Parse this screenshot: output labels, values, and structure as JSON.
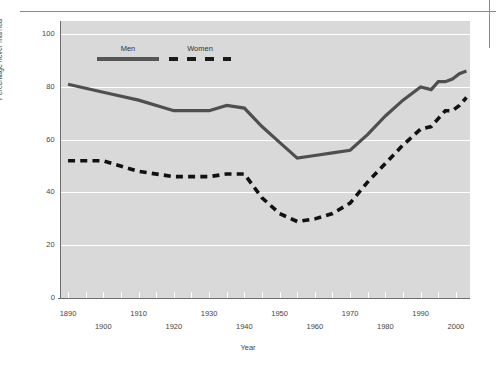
{
  "figure": {
    "background_color": "#ffffff",
    "plot_background_color": "#d9d9d9",
    "rule_color": "#8a8a8a"
  },
  "chart_data": {
    "type": "line",
    "title": "",
    "xlabel": "Year",
    "ylabel": "Percentage never married",
    "xlim": [
      1888,
      2004
    ],
    "ylim": [
      0,
      105
    ],
    "yticks": [
      0,
      20,
      40,
      60,
      80,
      100
    ],
    "ytick_labels": [
      "0",
      "20",
      "40",
      "60",
      "80",
      "100"
    ],
    "xticks": [
      1890,
      1900,
      1910,
      1920,
      1930,
      1940,
      1950,
      1960,
      1970,
      1980,
      1990,
      2000
    ],
    "xtick_labels": [
      "1890",
      "1900",
      "1910",
      "1920",
      "1930",
      "1940",
      "1950",
      "1960",
      "1970",
      "1980",
      "1990",
      "2000"
    ],
    "grid": "horizontal-white",
    "legend_position": "upper-left-inside",
    "colors": {
      "men": "#4f4f4f",
      "women": "#111111"
    },
    "series": [
      {
        "name": "Men",
        "style": "solid",
        "color": "#4f4f4f",
        "x": [
          1890,
          1900,
          1910,
          1920,
          1930,
          1935,
          1940,
          1945,
          1950,
          1955,
          1960,
          1965,
          1970,
          1975,
          1980,
          1985,
          1990,
          1993,
          1995,
          1997,
          1999,
          2001,
          2003
        ],
        "values": [
          81,
          78,
          75,
          71,
          71,
          73,
          72,
          65,
          59,
          53,
          54,
          55,
          56,
          62,
          69,
          75,
          80,
          79,
          82,
          82,
          83,
          85,
          86
        ]
      },
      {
        "name": "Women",
        "style": "dashed",
        "color": "#111111",
        "x": [
          1890,
          1900,
          1910,
          1920,
          1930,
          1935,
          1940,
          1945,
          1950,
          1955,
          1960,
          1965,
          1970,
          1975,
          1980,
          1985,
          1990,
          1993,
          1995,
          1997,
          1999,
          2001,
          2003
        ],
        "values": [
          52,
          52,
          48,
          46,
          46,
          47,
          47,
          38,
          32,
          29,
          30,
          32,
          36,
          44,
          51,
          58,
          64,
          65,
          68,
          71,
          71,
          73,
          76
        ]
      }
    ]
  },
  "legend": {
    "men_label": "Men",
    "women_label": "Women"
  },
  "axes": {
    "y_title": "Percentage never married",
    "x_title": "Year"
  }
}
